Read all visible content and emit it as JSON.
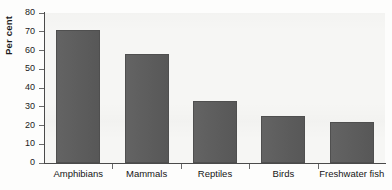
{
  "chart_data": {
    "type": "bar",
    "title": "",
    "xlabel": "",
    "ylabel": "Per cent",
    "categories": [
      "Amphibians",
      "Mammals",
      "Reptiles",
      "Birds",
      "Freshwater fish"
    ],
    "values": [
      71,
      58,
      33,
      25,
      22
    ],
    "ylim": [
      0,
      80
    ],
    "yticks": [
      0,
      10,
      20,
      30,
      40,
      50,
      60,
      70,
      80
    ],
    "ytick_labels": [
      "0",
      "10",
      "20",
      "30",
      "40",
      "50",
      "60",
      "70",
      "80"
    ],
    "grid": false,
    "legend": "none",
    "bar_color": "#5b5b5b",
    "axis_color": "#4a4a4a",
    "plot_background": "#f6f6f4",
    "text_color": "#151515"
  }
}
